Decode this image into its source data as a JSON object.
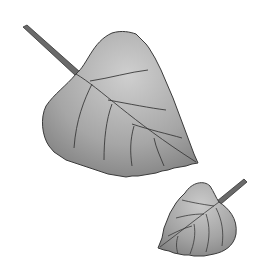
{
  "image": {
    "description": "Illustration of two heart-shaped serrated leaves with stems on white background",
    "background": "#ffffff",
    "leaves": [
      {
        "name": "large-leaf",
        "fill_light": "#c8c8c8",
        "fill_dark": "#7a7a7a",
        "outline": "#3a3a3a"
      },
      {
        "name": "small-leaf",
        "fill_light": "#c4c4c4",
        "fill_dark": "#808080",
        "outline": "#3a3a3a"
      }
    ]
  }
}
